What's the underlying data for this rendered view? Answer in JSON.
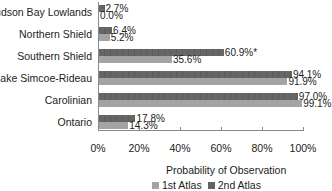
{
  "chart_data": {
    "type": "bar",
    "orientation": "horizontal",
    "title": "",
    "xlabel": "Probability of Observation",
    "ylabel": "",
    "xlim": [
      0,
      100
    ],
    "x_ticks": [
      "0%",
      "20%",
      "40%",
      "60%",
      "80%",
      "100%"
    ],
    "grid": false,
    "legend_position": "bottom",
    "categories": [
      "Hudson Bay Lowlands",
      "Northern Shield",
      "Southern Shield",
      "Lake Simcoe-Rideau",
      "Carolinian",
      "Ontario"
    ],
    "series": [
      {
        "name": "1st Atlas",
        "color": "#a4a4a4",
        "values": [
          0.0,
          5.2,
          35.6,
          91.9,
          99.1,
          14.3
        ],
        "labels": [
          "0.0%",
          "5.2%",
          "35.6%",
          "91.9%",
          "99.1%",
          "14.3%"
        ]
      },
      {
        "name": "2nd Atlas",
        "color": "#616161",
        "values": [
          2.7,
          6.4,
          60.9,
          94.1,
          97.0,
          17.8
        ],
        "labels": [
          "2.7%",
          "6.4%",
          "60.9%*",
          "94.1%",
          "97.0%",
          "17.8%"
        ]
      }
    ],
    "annotations": [
      "* on Southern Shield 2nd Atlas value (60.9%*)"
    ]
  },
  "axis": {
    "title": "Probability of Observation",
    "ticks": [
      "0%",
      "20%",
      "40%",
      "60%",
      "80%",
      "100%"
    ]
  },
  "legend": {
    "items": [
      {
        "label": "1st Atlas",
        "color": "#a4a4a4"
      },
      {
        "label": "2nd Atlas",
        "color": "#616161"
      }
    ]
  },
  "rows": [
    {
      "label": "Hudson Bay Lowlands",
      "s2": "2.7%",
      "s1": "0.0%"
    },
    {
      "label": "Northern Shield",
      "s2": "6.4%",
      "s1": "5.2%"
    },
    {
      "label": "Southern Shield",
      "s2": "60.9%*",
      "s1": "35.6%"
    },
    {
      "label": "Lake Simcoe-Rideau",
      "s2": "94.1%",
      "s1": "91.9%"
    },
    {
      "label": "Carolinian",
      "s2": "97.0%",
      "s1": "99.1%"
    },
    {
      "label": "Ontario",
      "s2": "17.8%",
      "s1": "14.3%"
    }
  ]
}
